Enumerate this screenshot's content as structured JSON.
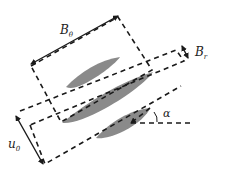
{
  "figure": {
    "colors": {
      "blade": "#8a8a8a",
      "line": "#1a1a1a",
      "background": "#ffffff"
    }
  },
  "labels": {
    "b_theta": {
      "main": "B",
      "sub": "θ"
    },
    "b_r": {
      "main": "B",
      "sub": "r"
    },
    "u0": {
      "main": "u",
      "sub": "0"
    },
    "alpha": "α"
  },
  "elements": {
    "blades": [
      "upper-blade",
      "middle-blade",
      "lower-blade"
    ],
    "boxes": [
      "b-theta-box",
      "b-r-band",
      "lower-band"
    ],
    "arrows": [
      "b-theta-arrow",
      "b-r-arrow",
      "u0-arrow"
    ],
    "angle_reference": "horizontal-reference-line"
  }
}
